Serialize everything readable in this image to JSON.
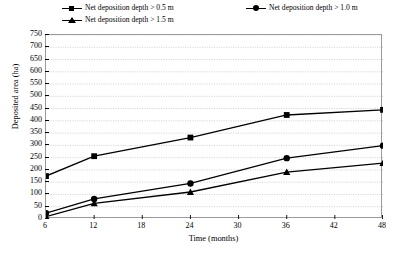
{
  "chart_data": {
    "type": "line",
    "title": "",
    "xlabel": "Time (months)",
    "ylabel": "Deposited area (ha)",
    "x": [
      6,
      12,
      24,
      36,
      48
    ],
    "categories": [
      "6",
      "12",
      "24",
      "36",
      "48"
    ],
    "xlim": [
      6,
      48
    ],
    "ylim": [
      0,
      750
    ],
    "xticks": [
      6,
      12,
      18,
      24,
      30,
      36,
      42,
      48
    ],
    "xtick_labels": [
      "6",
      "12",
      "18",
      "24",
      "30",
      "36",
      "42",
      "48"
    ],
    "yticks": [
      0,
      50,
      100,
      150,
      200,
      250,
      300,
      350,
      400,
      450,
      500,
      550,
      600,
      650,
      700,
      750
    ],
    "ytick_labels": [
      "0",
      "50",
      "100",
      "150",
      "200",
      "250",
      "300",
      "350",
      "400",
      "450",
      "500",
      "550",
      "600",
      "650",
      "700",
      "750"
    ],
    "grid": "horizontal-dotted",
    "legend_position": "top",
    "series": [
      {
        "name": "Net deposition depth > 0.5 m",
        "marker": "square",
        "color": "#000000",
        "values": [
          175,
          256,
          332,
          424,
          445
        ]
      },
      {
        "name": "Net deposition depth > 1.0 m",
        "marker": "circle",
        "color": "#000000",
        "values": [
          24,
          82,
          145,
          248,
          299
        ]
      },
      {
        "name": "Net deposition depth > 1.5 m",
        "marker": "triangle",
        "color": "#000000",
        "values": [
          10,
          64,
          110,
          191,
          228
        ]
      }
    ]
  },
  "legend": {
    "entries": [
      {
        "label": "Net deposition depth > 0.5 m",
        "marker": "square"
      },
      {
        "label": "Net deposition depth > 1.0 m",
        "marker": "circle"
      },
      {
        "label": "Net deposition depth > 1.5 m",
        "marker": "triangle"
      }
    ]
  },
  "axes": {
    "y_title": "Deposited area (ha)",
    "x_title": "Time (months)"
  },
  "colors": {
    "line": "#000000",
    "grid": "#b9b9b9",
    "frame": "#9a9a9a",
    "background": "#ffffff"
  }
}
